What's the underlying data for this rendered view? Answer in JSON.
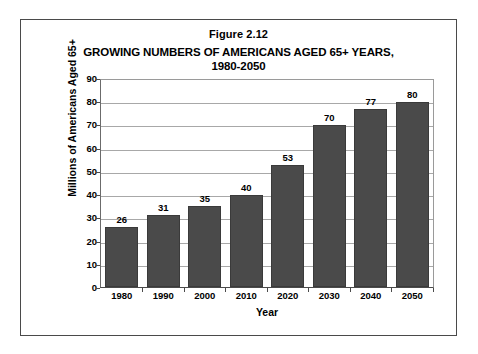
{
  "figure": {
    "number_label": "Figure 2.12"
  },
  "chart_data": {
    "type": "bar",
    "title": "GROWING NUMBERS OF AMERICANS AGED 65+ YEARS, 1980-2050",
    "title_line1": "GROWING NUMBERS OF AMERICANS AGED 65+ YEARS,",
    "title_line2": "1980-2050",
    "categories": [
      "1980",
      "1990",
      "2000",
      "2010",
      "2020",
      "2030",
      "2040",
      "2050"
    ],
    "values": [
      26,
      31,
      35,
      40,
      53,
      70,
      77,
      80
    ],
    "data_labels": [
      "26",
      "31",
      "35",
      "40",
      "53",
      "70",
      "77",
      "80"
    ],
    "xlabel": "Year",
    "ylabel": "Millions of Americans Aged 65+",
    "ylim": [
      0,
      90
    ],
    "ytick_step": 10,
    "yticks": [
      90,
      80,
      70,
      60,
      50,
      40,
      30,
      20,
      10,
      0
    ],
    "ytick_labels": [
      "90",
      "80",
      "70",
      "60",
      "50",
      "40",
      "30",
      "20",
      "10",
      "0"
    ],
    "grid": true,
    "grid_axis": "y",
    "legend": false,
    "bar_color": "#4a4a4a",
    "plot_background": "#ffffff",
    "axis_color": "#4a4a4a",
    "gridline_color": "#a8a8a8"
  }
}
